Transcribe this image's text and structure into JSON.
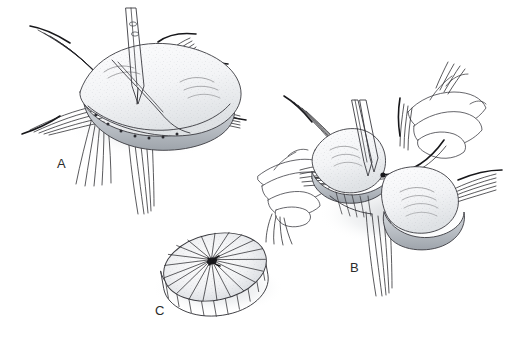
{
  "figure": {
    "background_color": "#ffffff",
    "ink_color": "#2c2c30",
    "tissue_fill_color": "#f2f3f4",
    "tissue_shadow_color": "#b8bcc0",
    "width": 514,
    "height": 348,
    "panel_count": 3
  },
  "panels": [
    {
      "id": "panel-a",
      "label": "A",
      "label_x": 57,
      "label_y": 168,
      "caption": "Tissue flap elevated and held with a forceps while radial sutures are passed through its margin",
      "instrument": "forceps",
      "hands_visible": 0,
      "suture_bundle_count": 6
    },
    {
      "id": "panel-b",
      "label": "B",
      "label_x": 350,
      "label_y": 272,
      "caption": "Two hands tie the radial sutures; the flap is drawn together at the centre",
      "instrument": "forceps",
      "hands_visible": 2,
      "suture_bundle_count": 6
    },
    {
      "id": "panel-c",
      "label": "C",
      "label_x": 155,
      "label_y": 315,
      "caption": "Completed radially pleated disc after all sutures are tightened",
      "instrument": "none",
      "hands_visible": 0,
      "pleat_count": 22
    }
  ],
  "colors": {
    "ink": "#2c2c30",
    "suture": "#232327",
    "tissue_light": "#fbfbfc",
    "tissue_mid": "#e3e5e8",
    "tissue_dark": "#b0b5bb",
    "shadow": "#d9dbde",
    "label_text": "#2b2b2b"
  }
}
